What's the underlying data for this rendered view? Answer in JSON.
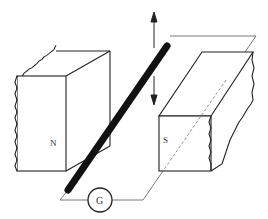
{
  "diagram": {
    "magnets": [
      {
        "id": "left",
        "pole_label": "N"
      },
      {
        "id": "right",
        "pole_label": "S"
      }
    ],
    "galvanometer": {
      "label": "G"
    },
    "rod_motion": "up-down (double-headed arrow)"
  }
}
